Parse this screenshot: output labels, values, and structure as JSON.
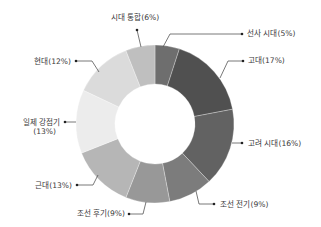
{
  "chart_data": {
    "type": "pie",
    "subtype": "donut",
    "title": "",
    "unit": "%",
    "categories": [
      "선사 시대",
      "고대",
      "고려 시대",
      "조선 전기",
      "조선 후기",
      "근대",
      "일제 강점기",
      "현대",
      "시대 통합"
    ],
    "values": [
      5,
      17,
      16,
      9,
      9,
      13,
      13,
      12,
      6
    ],
    "labels": [
      "선사 시대(5%)",
      "고대(17%)",
      "고려 시대(16%)",
      "조선 전기(9%)",
      "조선 후기(9%)",
      "근대(13%)",
      "일제 강점기 (13%)",
      "현대(12%)",
      "시대 통합(6%)"
    ],
    "colors": [
      "#6e6e6e",
      "#505050",
      "#626262",
      "#7c7c7c",
      "#989898",
      "#b6b6b6",
      "#ececec",
      "#dbdbdb",
      "#bfbfbf"
    ],
    "start_angle": "12 o'clock",
    "direction": "clockwise",
    "legend": "none (leader-line labels)"
  },
  "geometry": {
    "cx": 155,
    "cy": 124,
    "r_outer": 79,
    "r_inner": 40
  },
  "slice_labels": [
    {
      "lines": [
        "선사 시대(5%)"
      ],
      "x": 247,
      "y": 36,
      "anchor": "start",
      "dot": [
        242,
        34
      ],
      "path": "M 163 47 L 170 34 L 242 34"
    },
    {
      "lines": [
        "고대(17%)"
      ],
      "x": 248,
      "y": 63,
      "anchor": "start",
      "dot": [
        243,
        61
      ],
      "path": "M 220 78 L 228 61 L 243 61"
    },
    {
      "lines": [
        "고려 시대(16%)"
      ],
      "x": 248,
      "y": 146,
      "anchor": "start",
      "dot": [
        242,
        143
      ],
      "path": "M 232 143 L 242 143"
    },
    {
      "lines": [
        "조선 전기(9%)"
      ],
      "x": 220,
      "y": 207,
      "anchor": "start",
      "dot": [
        214,
        204
      ],
      "path": "M 196 191 L 199 204 L 214 204"
    },
    {
      "lines": [
        "조선 후기(9%)"
      ],
      "x": 125,
      "y": 216,
      "anchor": "end",
      "dot": [
        129,
        214
      ],
      "path": "M 146 202 L 143 214 L 129 214"
    },
    {
      "lines": [
        "근대(13%)"
      ],
      "x": 72,
      "y": 188,
      "anchor": "end",
      "dot": [
        77,
        185
      ],
      "path": "M 98 175 L 93 185 L 77 185"
    },
    {
      "lines": [
        "일제 강점기",
        "(13%)"
      ],
      "x": 60,
      "y": 125,
      "anchor": "end",
      "dot": [
        65,
        122
      ],
      "path": "M 76 122 L 65 122",
      "line_gap": 9
    },
    {
      "lines": [
        "현대(12%)"
      ],
      "x": 71,
      "y": 64,
      "anchor": "end",
      "dot": [
        76,
        61
      ],
      "path": "M 99 72 L 92 61 L 76 61"
    },
    {
      "lines": [
        "시대 통합(6%)"
      ],
      "x": 135,
      "y": 20,
      "anchor": "middle",
      "dot": [
        137,
        30
      ],
      "path": "M 137 30 L 141 47"
    }
  ]
}
